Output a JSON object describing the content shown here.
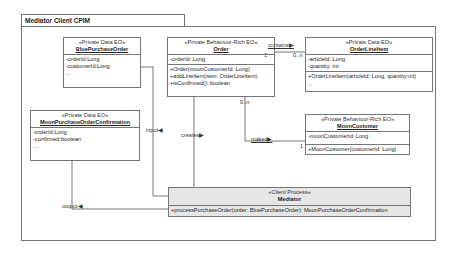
{
  "package": {
    "title": "Mediator Client CPIM"
  },
  "classes": {
    "blue_purchase_order": {
      "stereotype": "«Private Data EO»",
      "name": "BluePurchaseOrder",
      "attributes": [
        "-orderId:Long",
        "-customerId:Long",
        "..."
      ]
    },
    "order": {
      "stereotype": "«Private Behaviour-Rich  EO»",
      "name": "Order",
      "attributes": [
        "-orderId: Long"
      ],
      "operations": [
        "+Order(moonCustomerId: Long)",
        "+addLineItem(item: OrderLineItem)",
        "+isConfirmed(): boolean"
      ]
    },
    "order_line_item": {
      "stereotype": "«Private Data EO»",
      "name": "OrderLineItem",
      "attributes": [
        "-articleId: Long",
        "-quantity: int"
      ],
      "operations": [
        "+OrderLineItem(articleId: Long, quantity:int)",
        "..."
      ]
    },
    "moon_purchase_order_confirmation": {
      "stereotype": "«Private Data EO»",
      "name": "MoonPurchaseOrderConfirmation",
      "attributes": [
        "-orderId:Long",
        "-confirmed:boolean",
        "..."
      ]
    },
    "moon_customer": {
      "stereotype": "«Private Behaviour-Rich  EO»",
      "name": "MoonCustomer",
      "attributes": [
        "-moonCustomerId: Long"
      ],
      "operations": [
        "+MoonCustomer(customerId: Long)"
      ]
    },
    "mediator": {
      "stereotype": "«Client Process»",
      "name": "Mediator",
      "operations": [
        "+processPurchaseOrder(order: BluePurchaseOrder): MoonPurchaseOrderConfirmation"
      ]
    }
  },
  "associations": {
    "contains": {
      "label": "contains▶",
      "mult_source": "1",
      "mult_target": "0..n"
    },
    "makes": {
      "label": "makes▶",
      "mult_source": "0..n",
      "mult_target": "1"
    },
    "creates": {
      "label": "creates▶"
    },
    "input": {
      "label": "input◀"
    },
    "output": {
      "label": "output◀"
    }
  }
}
